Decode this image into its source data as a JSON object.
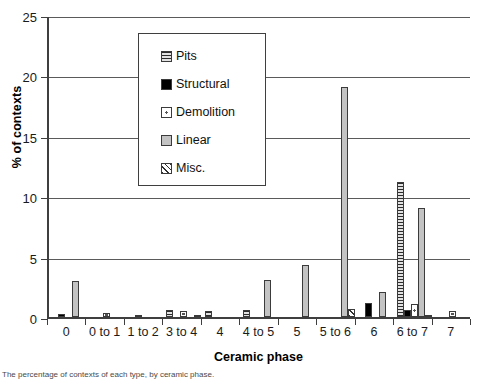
{
  "chart_data": {
    "type": "bar",
    "title": "",
    "xlabel": "Ceramic phase",
    "ylabel": "% of contexts",
    "ylim": [
      0,
      25
    ],
    "yticks": [
      0,
      5,
      10,
      15,
      20,
      25
    ],
    "grid": true,
    "legend_position": "inside-top-left",
    "categories": [
      "0",
      "0 to 1",
      "1 to 2",
      "3 to 4",
      "4",
      "4 to 5",
      "5",
      "5 to 6",
      "6",
      "6 to 7",
      "7"
    ],
    "series": [
      {
        "name": "Pits",
        "swatch": "horizontal-stripes",
        "values": [
          0,
          0,
          0,
          0.55,
          0.5,
          0.6,
          0,
          0,
          0,
          11.2,
          0
        ]
      },
      {
        "name": "Structural",
        "swatch": "solid-black",
        "values": [
          0.25,
          0,
          0.15,
          0,
          0,
          0,
          0,
          0,
          1.2,
          0.55,
          0
        ]
      },
      {
        "name": "Demolition",
        "swatch": "white-dotted",
        "values": [
          0,
          0.3,
          0,
          0.5,
          0,
          0,
          0,
          0,
          0,
          1.05,
          0.5
        ]
      },
      {
        "name": "Linear",
        "swatch": "solid-grey",
        "values": [
          3.0,
          0,
          0,
          0,
          0,
          3.1,
          4.3,
          19.0,
          2.1,
          9.0,
          0
        ]
      },
      {
        "name": "Misc.",
        "swatch": "diagonal-hatch",
        "values": [
          0,
          0,
          0,
          0.1,
          0,
          0,
          0,
          0.7,
          0,
          0.2,
          0
        ]
      }
    ]
  },
  "legend": {
    "items": [
      {
        "label": "Pits"
      },
      {
        "label": "Structural"
      },
      {
        "label": "Demolition"
      },
      {
        "label": "Linear"
      },
      {
        "label": "Misc."
      }
    ]
  },
  "caption": {
    "text": "The percentage of contexts of each type, by ceramic phase."
  }
}
